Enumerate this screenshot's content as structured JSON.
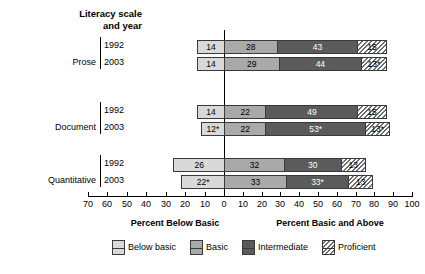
{
  "header": {
    "corner_title_line1": "Literacy scale",
    "corner_title_line2": "and year"
  },
  "axis": {
    "left_title": "Percent Below Basic",
    "right_title": "Percent Basic and Above",
    "tick_labels": [
      "70",
      "60",
      "50",
      "40",
      "30",
      "20",
      "10",
      "0",
      "10",
      "20",
      "30",
      "40",
      "50",
      "60",
      "70",
      "80",
      "90",
      "100"
    ]
  },
  "legend": {
    "items": [
      {
        "label": "Below basic",
        "key": "below",
        "color": "#d9d9d9"
      },
      {
        "label": "Basic",
        "key": "basic",
        "color": "#a9a9a9"
      },
      {
        "label": "Intermediate",
        "key": "intermediate",
        "color": "#5b5b5b"
      },
      {
        "label": "Proficient",
        "key": "proficient",
        "color": "#ffffff"
      }
    ]
  },
  "rows": [
    {
      "scale": "Prose",
      "year": "1992"
    },
    {
      "scale": "Prose",
      "year": "2003"
    },
    {
      "scale": "Document",
      "year": "1992"
    },
    {
      "scale": "Document",
      "year": "2003"
    },
    {
      "scale": "Quantitative",
      "year": "1992"
    },
    {
      "scale": "Quantitative",
      "year": "2003"
    }
  ],
  "group_labels": {
    "prose": "Prose",
    "document": "Document",
    "quantitative": "Quantitative"
  },
  "chart_data": {
    "type": "bar",
    "title": "",
    "subtitle": "",
    "orientation": "horizontal",
    "stacked": true,
    "diverging_at": "Below basic / Basic boundary",
    "xlabel_left": "Percent Below Basic",
    "xlabel_right": "Percent Basic and Above",
    "ylabel": "Literacy scale and year",
    "xlim": [
      -70,
      100
    ],
    "xticks": [
      -70,
      -60,
      -50,
      -40,
      -30,
      -20,
      -10,
      0,
      10,
      20,
      30,
      40,
      50,
      60,
      70,
      80,
      90,
      100
    ],
    "xticklabels": [
      "70",
      "60",
      "50",
      "40",
      "30",
      "20",
      "10",
      "0",
      "10",
      "20",
      "30",
      "40",
      "50",
      "60",
      "70",
      "80",
      "90",
      "100"
    ],
    "grid": false,
    "legend_position": "bottom",
    "legend": [
      "Below basic",
      "Basic",
      "Intermediate",
      "Proficient"
    ],
    "categories": [
      "Prose 1992",
      "Prose 2003",
      "Document 1992",
      "Document 2003",
      "Quantitative 1992",
      "Quantitative 2003"
    ],
    "series": [
      {
        "name": "Below basic",
        "values": [
          14,
          14,
          14,
          12,
          26,
          22
        ]
      },
      {
        "name": "Basic",
        "values": [
          28,
          29,
          22,
          22,
          32,
          33
        ]
      },
      {
        "name": "Intermediate",
        "values": [
          43,
          44,
          49,
          53,
          30,
          33
        ]
      },
      {
        "name": "Proficient",
        "values": [
          15,
          13,
          15,
          13,
          13,
          13
        ]
      }
    ],
    "data_labels": [
      {
        "category": "Prose 1992",
        "below": "14",
        "basic": "28",
        "intermediate": "43",
        "proficient": "15"
      },
      {
        "category": "Prose 2003",
        "below": "14",
        "basic": "29",
        "intermediate": "44",
        "proficient": "13*"
      },
      {
        "category": "Document 1992",
        "below": "14",
        "basic": "22",
        "intermediate": "49",
        "proficient": "15"
      },
      {
        "category": "Document 2003",
        "below": "12*",
        "basic": "22",
        "intermediate": "53*",
        "proficient": "13*"
      },
      {
        "category": "Quantitative 1992",
        "below": "26",
        "basic": "32",
        "intermediate": "30",
        "proficient": "13"
      },
      {
        "category": "Quantitative 2003",
        "below": "22*",
        "basic": "33",
        "intermediate": "33*",
        "proficient": "13"
      }
    ],
    "annotation": "* denotes a statistically significant difference from 1992"
  }
}
